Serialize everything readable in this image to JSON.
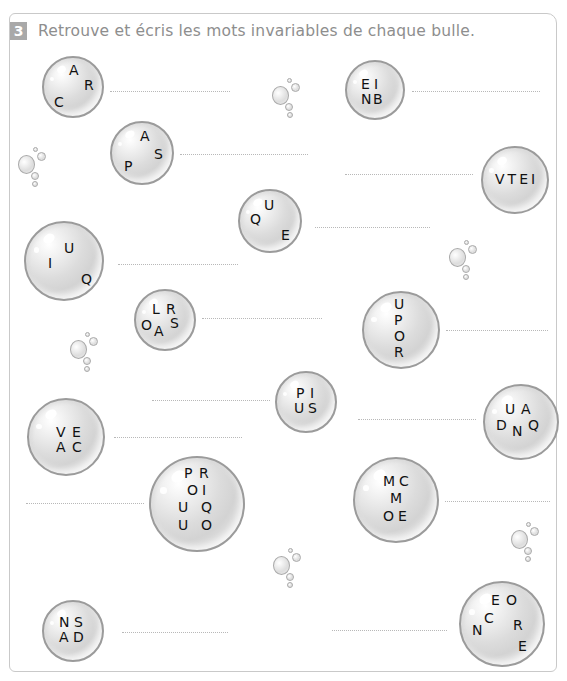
{
  "exercise": {
    "number": "3",
    "instruction": "Retrouve et écris les mots invariables de chaque bulle."
  },
  "bubbles": [
    {
      "id": "car",
      "letters": [
        "A",
        "R",
        "C"
      ]
    },
    {
      "id": "bien",
      "letters": [
        "E",
        "I",
        "N",
        "B"
      ]
    },
    {
      "id": "pas",
      "letters": [
        "A",
        "S",
        "P"
      ]
    },
    {
      "id": "vite",
      "letters": [
        "V",
        "T",
        "E",
        "I"
      ]
    },
    {
      "id": "que",
      "letters": [
        "U",
        "Q",
        "E"
      ]
    },
    {
      "id": "qui",
      "letters": [
        "U",
        "I",
        "Q"
      ]
    },
    {
      "id": "alors",
      "letters": [
        "L",
        "R",
        "O",
        "A",
        "S"
      ]
    },
    {
      "id": "pour",
      "letters": [
        "U",
        "P",
        "O",
        "R"
      ]
    },
    {
      "id": "puis",
      "letters": [
        "P",
        "I",
        "U",
        "S"
      ]
    },
    {
      "id": "quand",
      "letters": [
        "U",
        "A",
        "D",
        "N",
        "Q"
      ]
    },
    {
      "id": "avec",
      "letters": [
        "V",
        "E",
        "A",
        "C"
      ]
    },
    {
      "id": "pourquoi",
      "letters": [
        "P",
        "R",
        "O",
        "I",
        "U",
        "Q",
        "U",
        "O"
      ]
    },
    {
      "id": "comme",
      "letters": [
        "M",
        "C",
        "M",
        "O",
        "E"
      ]
    },
    {
      "id": "dans",
      "letters": [
        "N",
        "S",
        "A",
        "D"
      ]
    },
    {
      "id": "encore",
      "letters": [
        "E",
        "O",
        "C",
        "R",
        "N",
        "E"
      ]
    }
  ],
  "answer_lines": {
    "placeholder": ""
  }
}
